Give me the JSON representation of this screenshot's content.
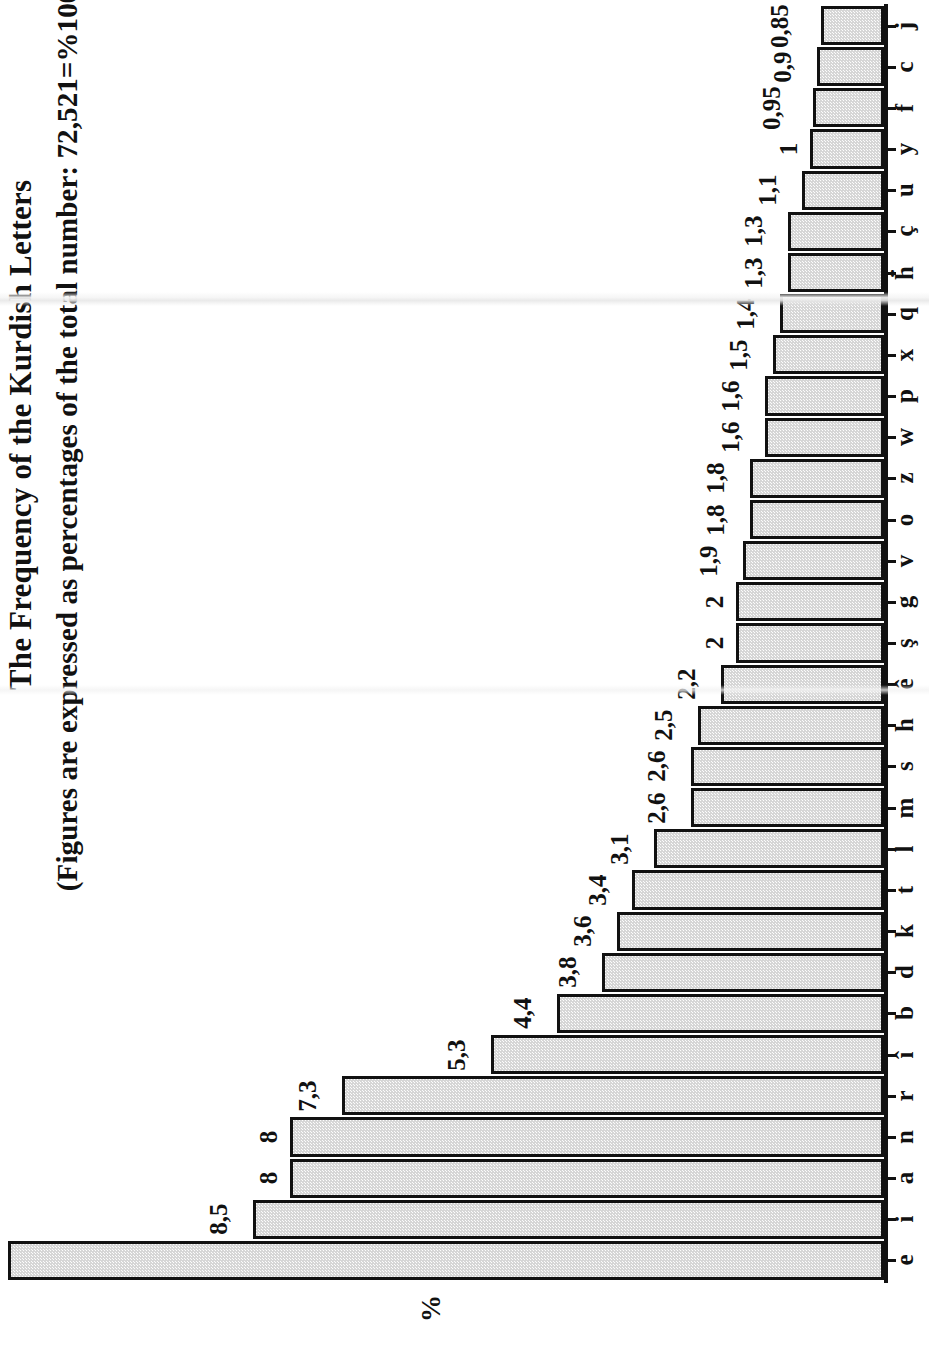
{
  "title": {
    "main": "The Frequency of the Kurdish Letters",
    "sub": "(Figures are expressed as percentages of the total number: 72,521=%100)"
  },
  "axis": {
    "value_axis_label": "%"
  },
  "chart_data": {
    "type": "bar",
    "orientation": "horizontal",
    "title": "The Frequency of the Kurdish Letters",
    "subtitle": "(Figures are expressed as percentages of the total number: 72,521=%100)",
    "xlabel": "%",
    "ylabel": "",
    "xlim": [
      0,
      11.8
    ],
    "grid": false,
    "legend": false,
    "decimal_separator": ",",
    "categories": [
      "e",
      "i",
      "a",
      "n",
      "r",
      "î",
      "b",
      "d",
      "k",
      "t",
      "l",
      "m",
      "s",
      "h",
      "ê",
      "ş",
      "g",
      "v",
      "o",
      "z",
      "w",
      "p",
      "x",
      "q",
      "ḧ",
      "ç",
      "u",
      "y",
      "f",
      "c",
      "j"
    ],
    "values": [
      11.8,
      8.5,
      8,
      8,
      7.3,
      5.3,
      4.4,
      3.8,
      3.6,
      3.4,
      3.1,
      2.6,
      2.6,
      2.5,
      2.2,
      2,
      2,
      1.9,
      1.8,
      1.8,
      1.6,
      1.6,
      1.5,
      1.4,
      1.3,
      1.3,
      1.1,
      1,
      0.95,
      0.9,
      0.85
    ],
    "value_labels": [
      "11,8",
      "8,5",
      "8",
      "8",
      "7,3",
      "5,3",
      "4,4",
      "3,8",
      "3,6",
      "3,4",
      "3,1",
      "2,6",
      "2,6",
      "2,5",
      "2,2",
      "2",
      "2",
      "1,9",
      "1,8",
      "1,8",
      "1,6",
      "1,6",
      "1,5",
      "1,4",
      "1,3",
      "1,3",
      "1,1",
      "1",
      "0,95",
      "0,9",
      "0,85"
    ],
    "colors": {
      "bar_fill": "#d6d6d6",
      "bar_border": "#111111",
      "background": "#ffffff",
      "text": "#111111"
    }
  }
}
